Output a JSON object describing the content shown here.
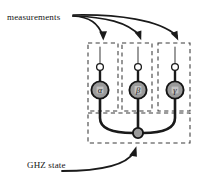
{
  "figure": {
    "background_color": "#ffffff",
    "width": 203,
    "height": 184
  },
  "annotations": {
    "measurements_label": "measurements",
    "ghz_label": "GHZ state"
  },
  "colors": {
    "line": "#1a1a1a",
    "dashed_box": "#3a3a3a",
    "node_fill": "#9a9a9a",
    "node_inner_fill": "#c0c0c0",
    "open_circle_fill": "#ffffff",
    "ghz_node_fill": "#9a9a9a",
    "text": "#141414"
  },
  "measurement_boxes": [
    {
      "name": "box-alpha",
      "symbol": "α",
      "x": 88,
      "y": 43,
      "width": 30,
      "height": 68,
      "wire_x": 100,
      "open_circle_cy": 67,
      "node_cy": 90
    },
    {
      "name": "box-beta",
      "symbol": "β",
      "x": 122,
      "y": 43,
      "width": 30,
      "height": 68,
      "wire_x": 138,
      "open_circle_cy": 67,
      "node_cy": 90
    },
    {
      "name": "box-gamma",
      "symbol": "γ",
      "x": 158,
      "y": 43,
      "width": 32,
      "height": 68,
      "wire_x": 175,
      "open_circle_cy": 67,
      "node_cy": 90
    }
  ],
  "ghz_box": {
    "name": "ghz-state-box",
    "x": 88,
    "y": 113,
    "width": 102,
    "height": 30,
    "center_node": {
      "cx": 138,
      "cy": 133,
      "r": 5
    }
  },
  "measurement_arrows": [
    {
      "name": "arrow-to-alpha",
      "target_x": 103,
      "target_y": 41
    },
    {
      "name": "arrow-to-beta",
      "target_x": 140,
      "target_y": 41
    },
    {
      "name": "arrow-to-gamma",
      "target_x": 177,
      "target_y": 41
    }
  ],
  "ghz_arrow": {
    "name": "arrow-to-ghz",
    "target_x": 136,
    "target_y": 146
  }
}
